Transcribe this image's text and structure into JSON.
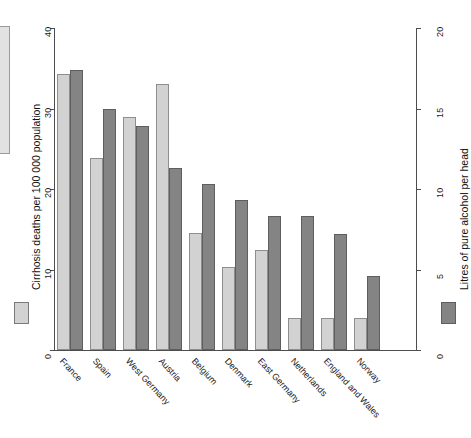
{
  "chart_data": {
    "type": "bar",
    "title": "",
    "subtitle": "",
    "categories": [
      "France",
      "Spain",
      "West Germany",
      "Austria",
      "Belgium",
      "Denmark",
      "East Germany",
      "Netherlands",
      "England and Wales",
      "Norway"
    ],
    "series": [
      {
        "name": "Cirrhosis deaths per 100 000 population",
        "axis": "left",
        "color": "#d2d2d2",
        "values": [
          34.3,
          23.9,
          29.0,
          33.1,
          14.5,
          10.3,
          12.4,
          4.0,
          4.0,
          4.0
        ]
      },
      {
        "name": "Litres of pure alcohol per head",
        "axis": "right",
        "color": "#848484",
        "values": [
          17.4,
          15.0,
          13.9,
          11.3,
          10.3,
          9.3,
          8.3,
          8.3,
          7.2,
          4.6
        ]
      }
    ],
    "xlabel": "",
    "ylabel": "Cirrhosis deaths per 100 000 population",
    "y2label": "Litres of pure alcohol per head",
    "ylim": [
      0,
      40
    ],
    "y2lim": [
      0,
      20
    ],
    "yticks": [
      "0",
      "10",
      "20",
      "30",
      "40"
    ],
    "ytick_values": [
      0,
      10,
      20,
      30,
      40
    ],
    "y2ticks": [
      "0",
      "5",
      "10",
      "15",
      "20"
    ],
    "y2tick_values": [
      0,
      5,
      10,
      15,
      20
    ],
    "grid": false,
    "legend_position": "outside-left-and-right"
  },
  "axes": {
    "left_title": "Cirrhosis deaths per 100 000 population",
    "right_title": "Litres of pure alcohol per head"
  },
  "legend": {
    "left_swatch_name": "cirrhosis-deaths-swatch",
    "right_swatch_name": "alcohol-litres-swatch"
  }
}
